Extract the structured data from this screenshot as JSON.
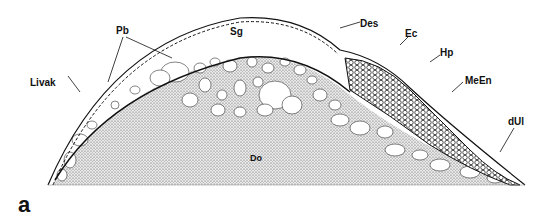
{
  "figure": {
    "panel_label": "a",
    "labels": {
      "pb": "Pb",
      "sg": "Sg",
      "des": "Des",
      "ec": "Ec",
      "hp": "Hp",
      "meen": "MeEn",
      "livak": "Livak",
      "dul": "dUl",
      "do": "Do"
    },
    "colors": {
      "ink": "#111111",
      "stipple": "#9a9a9a",
      "background": "#ffffff"
    }
  }
}
